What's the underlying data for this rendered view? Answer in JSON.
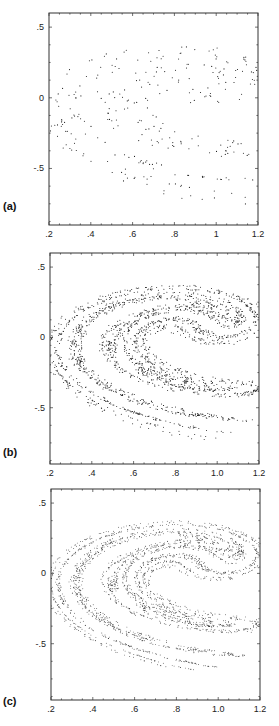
{
  "figure": {
    "panels": [
      {
        "id": "a",
        "label": "(a)",
        "top": 13,
        "left": 49,
        "width": 209,
        "height": 212,
        "noise": 0.022,
        "points": 1400,
        "dot": 0.55,
        "label_y": 200
      },
      {
        "id": "b",
        "label": "(b)",
        "top": 253,
        "left": 50,
        "width": 209,
        "height": 211,
        "noise": 0.007,
        "points": 2200,
        "dot": 0.5,
        "label_y": 446
      },
      {
        "id": "c",
        "label": "(c)",
        "top": 489,
        "left": 51,
        "width": 209,
        "height": 211,
        "noise": 0.0025,
        "points": 2600,
        "dot": 0.45,
        "label_y": 695
      }
    ]
  },
  "chart_data": [
    {
      "type": "scatter",
      "title": "",
      "panel_label": "(a)",
      "xlabel": "",
      "ylabel": "",
      "xlim": [
        0.2,
        1.2
      ],
      "ylim": [
        -0.9,
        0.6
      ],
      "xticks": [
        0.2,
        0.4,
        0.6,
        0.8,
        1.0,
        1.2
      ],
      "xtick_labels": [
        ".2",
        ".4",
        ".6",
        ".8",
        "1",
        "1.2"
      ],
      "yticks": [
        0.5,
        0.0,
        -0.5
      ],
      "ytick_labels": [
        ".5",
        "0",
        "-.5"
      ],
      "grid": false,
      "description": "Noisy, diffuse crescent-shaped strange attractor (Ikeda-type map); outer arm from (0.3,0.13) to (1.05,0.35); inner arm curves from (0.98,0.22) down through (0.45,-0.2) to (0.73,-0.74)"
    },
    {
      "type": "scatter",
      "title": "",
      "panel_label": "(b)",
      "xlabel": "",
      "ylabel": "",
      "xlim": [
        0.2,
        1.2
      ],
      "ylim": [
        -0.9,
        0.6
      ],
      "xticks": [
        0.2,
        0.4,
        0.6,
        0.8,
        1.0,
        1.2
      ],
      "xtick_labels": [
        ".2",
        ".4",
        ".6",
        ".8",
        "1.0",
        "1.2"
      ],
      "yticks": [
        0.5,
        0.0,
        -0.5
      ],
      "ytick_labels": [
        ".5",
        "0",
        "-.5"
      ],
      "grid": false,
      "description": "Same attractor with reduced noise; layered filament structure visible"
    },
    {
      "type": "scatter",
      "title": "",
      "panel_label": "(c)",
      "xlabel": "",
      "ylabel": "",
      "xlim": [
        0.2,
        1.2
      ],
      "ylim": [
        -0.9,
        0.6
      ],
      "xticks": [
        0.2,
        0.4,
        0.6,
        0.8,
        1.0,
        1.2
      ],
      "xtick_labels": [
        ".2",
        ".4",
        ".6",
        ".8",
        "1.0",
        "1.2"
      ],
      "yticks": [
        0.5,
        0.0,
        -0.5
      ],
      "ytick_labels": [
        ".5",
        "0",
        "-.5"
      ],
      "grid": false,
      "description": "Same attractor, near noise-free; sharp fractal filaments"
    }
  ],
  "colors": {
    "axis": "#333333",
    "points": "#1a1a1a",
    "background": "#ffffff"
  }
}
